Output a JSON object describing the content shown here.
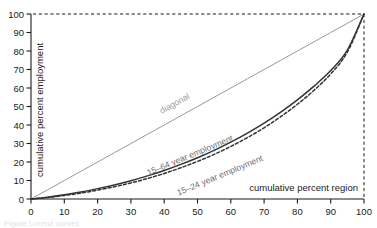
{
  "chart_data": {
    "type": "line",
    "title": "",
    "xlabel": "cumulative percent region",
    "ylabel": "cumulative percent employment",
    "xlim": [
      0,
      100
    ],
    "ylim": [
      0,
      100
    ],
    "xticks": [
      "0",
      "10",
      "20",
      "30",
      "40",
      "50",
      "60",
      "70",
      "80",
      "90",
      "100"
    ],
    "yticks": [
      "0",
      "10",
      "20",
      "30",
      "40",
      "50",
      "60",
      "70",
      "80",
      "90",
      "100"
    ],
    "grid": false,
    "legend_position": "inline-annotations",
    "annotations": [
      {
        "text": "diagonal",
        "x": 42,
        "y": 46
      },
      {
        "text": "15–64 year employment",
        "x": 48,
        "y": 21
      },
      {
        "text": "15–24 year employment",
        "x": 57,
        "y": 14
      }
    ],
    "x": [
      0,
      5,
      10,
      15,
      20,
      25,
      30,
      35,
      40,
      45,
      50,
      55,
      60,
      65,
      70,
      75,
      80,
      85,
      90,
      95,
      100
    ],
    "series": [
      {
        "name": "diagonal",
        "style": "solid-thin-gray",
        "color": "#8c8c8c",
        "values": [
          0,
          5,
          10,
          15,
          20,
          25,
          30,
          35,
          40,
          45,
          50,
          55,
          60,
          65,
          70,
          75,
          80,
          85,
          90,
          95,
          100
        ]
      },
      {
        "name": "15–64 year employment",
        "style": "solid",
        "color": "#333333",
        "values": [
          0,
          1.0,
          2.3,
          3.8,
          5.6,
          7.6,
          9.9,
          12.5,
          15.4,
          18.7,
          22.3,
          26.3,
          30.7,
          35.6,
          41.0,
          47.0,
          53.6,
          61.0,
          69.4,
          80.5,
          100
        ]
      },
      {
        "name": "15–24 year employment",
        "style": "dashed",
        "color": "#333333",
        "values": [
          0,
          0.8,
          1.9,
          3.2,
          4.8,
          6.6,
          8.7,
          11.1,
          13.8,
          16.9,
          20.3,
          24.1,
          28.4,
          33.2,
          38.5,
          44.5,
          51.2,
          58.8,
          67.6,
          79.4,
          100
        ]
      }
    ],
    "reference_lines": [
      {
        "name": "top-reference",
        "orientation": "horizontal",
        "value": 100,
        "style": "dashed"
      },
      {
        "name": "right-reference",
        "orientation": "vertical",
        "value": 100,
        "style": "dashed"
      }
    ]
  },
  "caption": {
    "text": "Figure  Lorenz curves"
  }
}
